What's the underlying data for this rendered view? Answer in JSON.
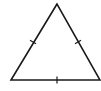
{
  "diagram": {
    "type": "equilateral-triangle",
    "stroke_color": "#1a1a1a",
    "background": "#ffffff",
    "vertices": {
      "apex": [
        57,
        4
      ],
      "bottom_left": [
        11,
        80
      ],
      "bottom_right": [
        100,
        80
      ]
    },
    "tick_marks": {
      "left_side": [
        33,
        42
      ],
      "right_side": [
        78,
        42
      ],
      "base": [
        57,
        80
      ]
    }
  }
}
